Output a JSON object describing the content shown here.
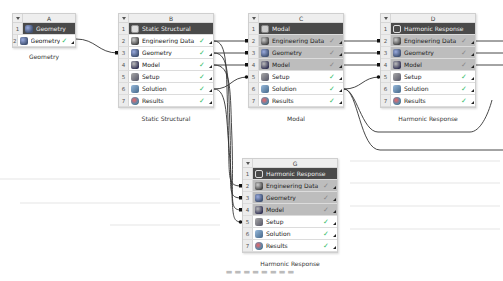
{
  "systems": {
    "A": {
      "letter": "A",
      "title": "Geometry",
      "label": "Geometry",
      "rows": [
        {
          "num": "2",
          "label": "Geometry",
          "icon": "geometry-icon",
          "status": "✓"
        }
      ]
    },
    "B": {
      "letter": "B",
      "title": "Static Structural",
      "label": "Static Structural",
      "rows": [
        {
          "num": "2",
          "label": "Engineering Data",
          "status": "✓"
        },
        {
          "num": "3",
          "label": "Geometry",
          "status": "✓"
        },
        {
          "num": "4",
          "label": "Model",
          "status": "✓"
        },
        {
          "num": "5",
          "label": "Setup",
          "status": "✓"
        },
        {
          "num": "6",
          "label": "Solution",
          "status": "✓"
        },
        {
          "num": "7",
          "label": "Results",
          "status": "✓"
        }
      ]
    },
    "C": {
      "letter": "C",
      "title": "Modal",
      "label": "Modal",
      "rows": [
        {
          "num": "2",
          "label": "Engineering Data",
          "status": "✓"
        },
        {
          "num": "3",
          "label": "Geometry",
          "status": "✓"
        },
        {
          "num": "4",
          "label": "Model",
          "status": "✓"
        },
        {
          "num": "5",
          "label": "Setup",
          "status": "✓"
        },
        {
          "num": "6",
          "label": "Solution",
          "status": "✓"
        },
        {
          "num": "7",
          "label": "Results",
          "status": "✓"
        }
      ]
    },
    "D": {
      "letter": "D",
      "title": "Harmonic Response",
      "label": "Harmonic Response",
      "rows": [
        {
          "num": "2",
          "label": "Engineering Data",
          "status": "✓"
        },
        {
          "num": "3",
          "label": "Geometry",
          "status": "✓"
        },
        {
          "num": "4",
          "label": "Model",
          "status": "✓"
        },
        {
          "num": "5",
          "label": "Setup",
          "status": "✓"
        },
        {
          "num": "6",
          "label": "Solution",
          "status": "✓"
        },
        {
          "num": "7",
          "label": "Results",
          "status": "✓"
        }
      ]
    },
    "G": {
      "letter": "G",
      "title": "Harmonic Response",
      "label": "Harmonic Response",
      "rows": [
        {
          "num": "2",
          "label": "Engineering Data",
          "status": "✓"
        },
        {
          "num": "3",
          "label": "Geometry",
          "status": "✓"
        },
        {
          "num": "4",
          "label": "Model",
          "status": "✓"
        },
        {
          "num": "5",
          "label": "Setup",
          "status": "✓"
        },
        {
          "num": "6",
          "label": "Solution",
          "status": "✓"
        },
        {
          "num": "7",
          "label": "Results",
          "status": "✓"
        }
      ]
    }
  },
  "row_one_num": "1",
  "colors": {
    "title_row": "#4a4a4a",
    "shared_row": "#bdbdbd",
    "wire": "#333333"
  }
}
